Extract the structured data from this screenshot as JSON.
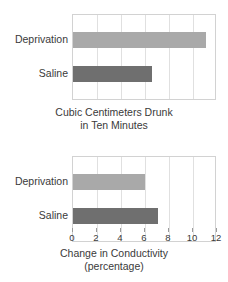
{
  "chart_data": [
    {
      "type": "bar",
      "orientation": "horizontal",
      "title": "",
      "xlabel": "Cubic Centimeters Drunk in Ten Minutes",
      "xlabel_lines": [
        "Cubic Centimeters Drunk",
        "in Ten Minutes"
      ],
      "ylabel": "",
      "categories": [
        "Deprivation",
        "Saline"
      ],
      "values": [
        11.1,
        6.6
      ],
      "xlim": [
        0,
        12
      ],
      "grid": true,
      "ticks_visible": false,
      "tick_labels": [],
      "legend": "none",
      "colors": [
        "#a9a9a9",
        "#6f6f6f"
      ]
    },
    {
      "type": "bar",
      "orientation": "horizontal",
      "title": "",
      "xlabel": "Change in Conductivity (percentage)",
      "xlabel_lines": [
        "Change in Conductivity",
        "(percentage)"
      ],
      "ylabel": "",
      "categories": [
        "Deprivation",
        "Saline"
      ],
      "values": [
        6.0,
        7.1
      ],
      "xlim": [
        0,
        12
      ],
      "grid": true,
      "ticks_visible": true,
      "tick_labels": [
        "0",
        "2",
        "4",
        "6",
        "8",
        "10",
        "12"
      ],
      "tick_values": [
        0,
        2,
        4,
        6,
        8,
        10,
        12
      ],
      "legend": "none",
      "colors": [
        "#a9a9a9",
        "#6f6f6f"
      ]
    }
  ],
  "top_chart": {
    "category_deprivation": "Deprivation",
    "category_saline": "Saline",
    "axis_title_line1": "Cubic Centimeters Drunk",
    "axis_title_line2": "in Ten Minutes"
  },
  "bottom_chart": {
    "category_deprivation": "Deprivation",
    "category_saline": "Saline",
    "axis_title_line1": "Change in Conductivity",
    "axis_title_line2": "(percentage)",
    "tick_0": "0",
    "tick_1": "2",
    "tick_2": "4",
    "tick_3": "6",
    "tick_4": "8",
    "tick_5": "10",
    "tick_6": "12"
  },
  "style": {
    "bar_light_color": "#a9a9a9",
    "bar_dark_color": "#6f6f6f",
    "frame_color": "#d2d2d2",
    "grid_color": "#e0e0e0",
    "text_color": "#3a3a3a",
    "background": "#ffffff"
  }
}
